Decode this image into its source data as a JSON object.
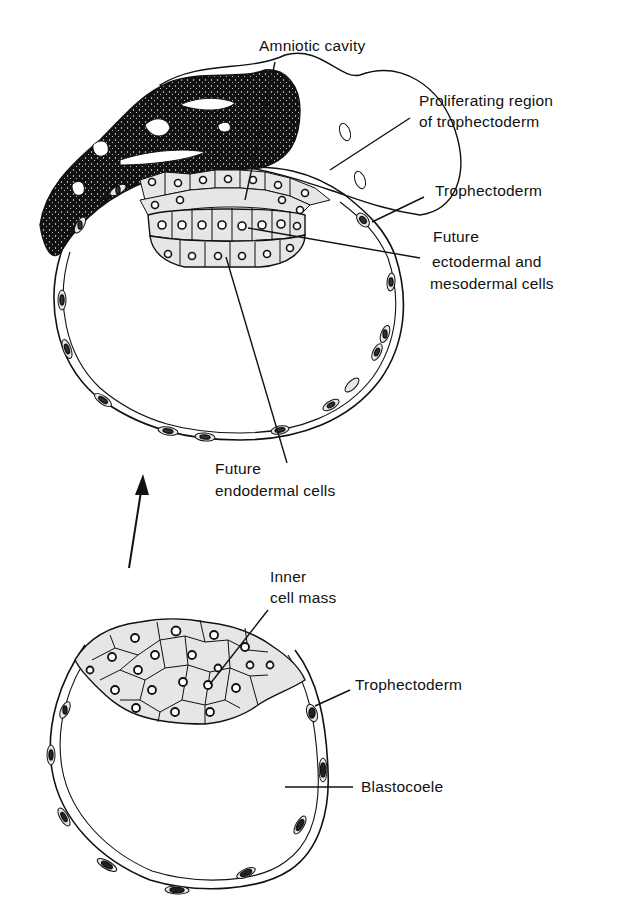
{
  "figure": {
    "top_diagram": {
      "name": "Implanting blastocyst",
      "labels": {
        "amniotic_cavity": "Amniotic cavity",
        "proliferating_region_line1": "Proliferating region",
        "proliferating_region_line2": "of trophectoderm",
        "trophectoderm": "Trophectoderm",
        "future_ecto_line1": "Future",
        "future_ecto_line2": "ectodermal and",
        "future_ecto_line3": "mesodermal cells",
        "future_endo_line1": "Future",
        "future_endo_line2": "endodermal cells"
      }
    },
    "bottom_diagram": {
      "name": "Blastocyst",
      "labels": {
        "inner_cell_mass_line1": "Inner",
        "inner_cell_mass_line2": "cell mass",
        "trophectoderm": "Trophectoderm",
        "blastocoele": "Blastocoele"
      }
    },
    "arrow": {
      "direction": "up",
      "meaning": "development progression"
    },
    "colors": {
      "ink": "#111111",
      "cell_fill": "#e6e6e6",
      "dark_region": "#0d0d0d",
      "background": "#ffffff"
    }
  }
}
